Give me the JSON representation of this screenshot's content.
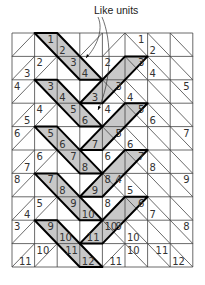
{
  "callout": {
    "label": "Like units"
  },
  "grid": {
    "cols": 8,
    "rows": 10,
    "x0": 12,
    "y0": 33,
    "cw": 22.6,
    "rh": 23.4
  },
  "colors": {
    "shade": "#c8c8c8",
    "line": "#444444",
    "bold": "#000000"
  },
  "diagonals": [
    "/\\\\//\\\\\\",
    "//\\\\/\\\\\\",
    "/\\\\/\\\\\\\\",
    "//\\\\/\\\\\\",
    "/\\\\/\\\\\\\\",
    "//\\\\/\\\\\\",
    "/\\\\/\\\\\\\\",
    "//\\\\/\\\\\\",
    "/\\\\/\\\\\\\\",
    "//\\\\/\\\\\\"
  ],
  "shaded_bands": [
    {
      "pts": [
        [
          1,
          0
        ],
        [
          2,
          0
        ],
        [
          4,
          2
        ],
        [
          3,
          2
        ]
      ]
    },
    {
      "pts": [
        [
          4,
          2
        ],
        [
          5,
          1
        ],
        [
          6,
          1
        ],
        [
          4,
          3
        ],
        [
          3,
          3
        ]
      ]
    },
    {
      "pts": [
        [
          1,
          2
        ],
        [
          2,
          2
        ],
        [
          4,
          4
        ],
        [
          3,
          4
        ]
      ]
    },
    {
      "pts": [
        [
          4,
          4
        ],
        [
          5,
          3
        ],
        [
          6,
          3
        ],
        [
          4,
          5
        ],
        [
          3,
          5
        ]
      ]
    },
    {
      "pts": [
        [
          1,
          4
        ],
        [
          2,
          4
        ],
        [
          4,
          6
        ],
        [
          3,
          6
        ]
      ]
    },
    {
      "pts": [
        [
          4,
          6
        ],
        [
          5,
          5
        ],
        [
          6,
          5
        ],
        [
          4,
          7
        ],
        [
          3,
          7
        ]
      ]
    },
    {
      "pts": [
        [
          1,
          6
        ],
        [
          2,
          6
        ],
        [
          4,
          8
        ],
        [
          3,
          8
        ]
      ]
    },
    {
      "pts": [
        [
          4,
          8
        ],
        [
          5,
          7
        ],
        [
          6,
          7
        ],
        [
          4,
          9
        ],
        [
          3,
          9
        ]
      ]
    },
    {
      "pts": [
        [
          1,
          8
        ],
        [
          2,
          8
        ],
        [
          4,
          10
        ],
        [
          3,
          10
        ]
      ]
    }
  ],
  "labels": [
    {
      "t": "1",
      "c": 1,
      "r": 0,
      "pos": "tr"
    },
    {
      "t": "2",
      "c": 2,
      "r": 0,
      "pos": "bl"
    },
    {
      "t": "1",
      "c": 5,
      "r": 0,
      "pos": "tr"
    },
    {
      "t": "2",
      "c": 6,
      "r": 0,
      "pos": "bl"
    },
    {
      "t": "3",
      "c": 0,
      "r": 1,
      "pos": "br"
    },
    {
      "t": "2",
      "c": 1,
      "r": 1,
      "pos": "tl"
    },
    {
      "t": "3",
      "c": 2,
      "r": 1,
      "pos": "tr"
    },
    {
      "t": "4",
      "c": 3,
      "r": 1,
      "pos": "bl"
    },
    {
      "t": "2",
      "c": 4,
      "r": 1,
      "pos": "tl"
    },
    {
      "t": "3",
      "c": 5,
      "r": 1,
      "pos": "tr"
    },
    {
      "t": "4",
      "c": 6,
      "r": 1,
      "pos": "bl"
    },
    {
      "t": "4",
      "c": 0,
      "r": 2,
      "pos": "tl"
    },
    {
      "t": "3",
      "c": 1,
      "r": 2,
      "pos": "tr"
    },
    {
      "t": "4",
      "c": 2,
      "r": 2,
      "pos": "bl"
    },
    {
      "t": "3",
      "c": 3,
      "r": 2,
      "pos": "br"
    },
    {
      "t": "3",
      "c": 4,
      "r": 2,
      "pos": "tr"
    },
    {
      "t": "4",
      "c": 5,
      "r": 2,
      "pos": "bl"
    },
    {
      "t": "5",
      "c": 7,
      "r": 2,
      "pos": "tr"
    },
    {
      "t": "5",
      "c": 0,
      "r": 3,
      "pos": "br"
    },
    {
      "t": "4",
      "c": 1,
      "r": 3,
      "pos": "tl"
    },
    {
      "t": "5",
      "c": 2,
      "r": 3,
      "pos": "tr"
    },
    {
      "t": "6",
      "c": 3,
      "r": 3,
      "pos": "bl"
    },
    {
      "t": "4",
      "c": 4,
      "r": 3,
      "pos": "tl"
    },
    {
      "t": "5",
      "c": 5,
      "r": 3,
      "pos": "tr"
    },
    {
      "t": "6",
      "c": 6,
      "r": 3,
      "pos": "bl"
    },
    {
      "t": "6",
      "c": 0,
      "r": 4,
      "pos": "tl"
    },
    {
      "t": "5",
      "c": 1,
      "r": 4,
      "pos": "tr"
    },
    {
      "t": "6",
      "c": 2,
      "r": 4,
      "pos": "bl"
    },
    {
      "t": "7",
      "c": 3,
      "r": 4,
      "pos": "br"
    },
    {
      "t": "5",
      "c": 4,
      "r": 4,
      "pos": "tr"
    },
    {
      "t": "6",
      "c": 5,
      "r": 4,
      "pos": "bl"
    },
    {
      "t": "7",
      "c": 7,
      "r": 4,
      "pos": "tr"
    },
    {
      "t": "7",
      "c": 0,
      "r": 5,
      "pos": "br"
    },
    {
      "t": "6",
      "c": 1,
      "r": 5,
      "pos": "tl"
    },
    {
      "t": "7",
      "c": 2,
      "r": 5,
      "pos": "tr"
    },
    {
      "t": "8",
      "c": 3,
      "r": 5,
      "pos": "bl"
    },
    {
      "t": "6",
      "c": 4,
      "r": 5,
      "pos": "tl"
    },
    {
      "t": "7",
      "c": 5,
      "r": 5,
      "pos": "tr"
    },
    {
      "t": "8",
      "c": 6,
      "r": 5,
      "pos": "bl"
    },
    {
      "t": "8",
      "c": 0,
      "r": 6,
      "pos": "tl"
    },
    {
      "t": "7",
      "c": 1,
      "r": 6,
      "pos": "tr"
    },
    {
      "t": "8",
      "c": 2,
      "r": 6,
      "pos": "bl"
    },
    {
      "t": "9",
      "c": 3,
      "r": 6,
      "pos": "br"
    },
    {
      "t": "8",
      "c": 4,
      "r": 6,
      "pos": "tl"
    },
    {
      "t": "4",
      "c": 4,
      "r": 6,
      "pos": "tr2"
    },
    {
      "t": "5",
      "c": 5,
      "r": 6,
      "pos": "bl"
    },
    {
      "t": "9",
      "c": 7,
      "r": 6,
      "pos": "tr"
    },
    {
      "t": "4",
      "c": 0,
      "r": 7,
      "pos": "br"
    },
    {
      "t": "5",
      "c": 1,
      "r": 7,
      "pos": "tl"
    },
    {
      "t": "9",
      "c": 2,
      "r": 7,
      "pos": "tr"
    },
    {
      "t": "10",
      "c": 3,
      "r": 7,
      "pos": "bl"
    },
    {
      "t": "8",
      "c": 4,
      "r": 7,
      "pos": "tl"
    },
    {
      "t": "6",
      "c": 5,
      "r": 7,
      "pos": "tr"
    },
    {
      "t": "7",
      "c": 6,
      "r": 7,
      "pos": "bl"
    },
    {
      "t": "3",
      "c": 0,
      "r": 8,
      "pos": "tl"
    },
    {
      "t": "9",
      "c": 1,
      "r": 8,
      "pos": "tr"
    },
    {
      "t": "10",
      "c": 2,
      "r": 8,
      "pos": "bl"
    },
    {
      "t": "11",
      "c": 3,
      "r": 8,
      "pos": "br"
    },
    {
      "t": "10",
      "c": 4,
      "r": 8,
      "pos": "tl"
    },
    {
      "t": "9",
      "c": 4,
      "r": 8,
      "pos": "tr2"
    },
    {
      "t": "10",
      "c": 5,
      "r": 8,
      "pos": "bl"
    },
    {
      "t": "8",
      "c": 7,
      "r": 8,
      "pos": "tr"
    },
    {
      "t": "11",
      "c": 0,
      "r": 9,
      "pos": "br"
    },
    {
      "t": "10",
      "c": 1,
      "r": 9,
      "pos": "tl"
    },
    {
      "t": "11",
      "c": 2,
      "r": 9,
      "pos": "tr"
    },
    {
      "t": "12",
      "c": 3,
      "r": 9,
      "pos": "bl"
    },
    {
      "t": "11",
      "c": 4,
      "r": 9,
      "pos": "br"
    },
    {
      "t": "10",
      "c": 5,
      "r": 9,
      "pos": "tl"
    },
    {
      "t": "11",
      "c": 6,
      "r": 9,
      "pos": "tr"
    },
    {
      "t": "12",
      "c": 7,
      "r": 9,
      "pos": "bl"
    }
  ]
}
